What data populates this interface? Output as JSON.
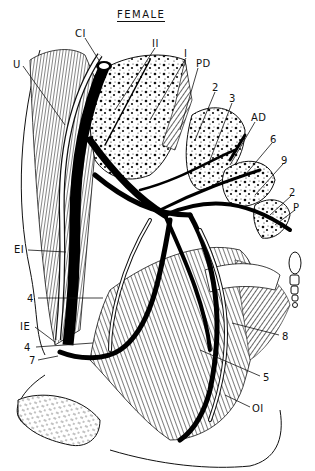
{
  "title": "FEMALE",
  "labels": [
    {
      "id": "CI",
      "text": "CI",
      "x": 75,
      "y": 29
    },
    {
      "id": "II",
      "text": "II",
      "x": 152,
      "y": 39
    },
    {
      "id": "U",
      "text": "U",
      "x": 13,
      "y": 60
    },
    {
      "id": "I",
      "text": "I",
      "x": 184,
      "y": 49
    },
    {
      "id": "PD",
      "text": "PD",
      "x": 196,
      "y": 59
    },
    {
      "id": "2a",
      "text": "2",
      "x": 212,
      "y": 83
    },
    {
      "id": "3",
      "text": "3",
      "x": 229,
      "y": 94
    },
    {
      "id": "AD",
      "text": "AD",
      "x": 251,
      "y": 113
    },
    {
      "id": "6",
      "text": "6",
      "x": 270,
      "y": 135
    },
    {
      "id": "9",
      "text": "9",
      "x": 281,
      "y": 156
    },
    {
      "id": "2b",
      "text": "2",
      "x": 289,
      "y": 188
    },
    {
      "id": "P",
      "text": "P",
      "x": 293,
      "y": 203
    },
    {
      "id": "EI",
      "text": "EI",
      "x": 14,
      "y": 245
    },
    {
      "id": "4a",
      "text": "4",
      "x": 27,
      "y": 294
    },
    {
      "id": "IE",
      "text": "IE",
      "x": 20,
      "y": 322
    },
    {
      "id": "4b",
      "text": "4",
      "x": 24,
      "y": 343
    },
    {
      "id": "7",
      "text": "7",
      "x": 29,
      "y": 356
    },
    {
      "id": "8",
      "text": "8",
      "x": 282,
      "y": 332
    },
    {
      "id": "5",
      "text": "5",
      "x": 263,
      "y": 373
    },
    {
      "id": "OI",
      "text": "OI",
      "x": 252,
      "y": 404
    }
  ]
}
